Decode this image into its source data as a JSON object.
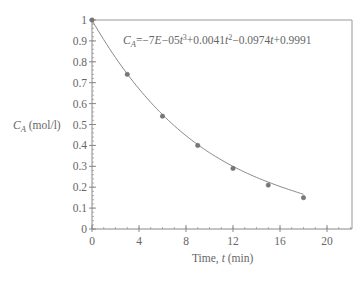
{
  "chart_data": {
    "type": "scatter",
    "title": "",
    "xlabel": "Time, t (min)",
    "xlabel_parts": {
      "prefix": "Time, ",
      "var": "t",
      "suffix": " (min)"
    },
    "ylabel": "C_A (mol/l)",
    "ylabel_parts": {
      "var": "C",
      "sub": "A",
      "suffix": " (mol/l)"
    },
    "xlim": [
      0,
      22
    ],
    "ylim": [
      0,
      1
    ],
    "x_ticks": [
      0,
      4,
      8,
      12,
      16,
      20
    ],
    "x_tick_labels": [
      "0",
      "4",
      "8",
      "12",
      "16",
      "20"
    ],
    "y_ticks": [
      0,
      0.1,
      0.2,
      0.3,
      0.4,
      0.5,
      0.6,
      0.7,
      0.8,
      0.9,
      1
    ],
    "y_tick_labels": [
      "0",
      "0.1",
      "0.2",
      "0.3",
      "0.4",
      "0.5",
      "0.6",
      "0.7",
      "0.8",
      "0.9",
      "1"
    ],
    "grid": false,
    "series": [
      {
        "name": "Measured C_A",
        "x": [
          0,
          3,
          6,
          9,
          12,
          15,
          18
        ],
        "values": [
          1.0,
          0.74,
          0.54,
          0.4,
          0.29,
          0.21,
          0.15
        ],
        "marker": "circle",
        "color": "#777777"
      },
      {
        "name": "Polynomial fit",
        "type": "line",
        "coefficients": {
          "t3": -7e-05,
          "t2": 0.0041,
          "t1": -0.0974,
          "c": 0.9991
        },
        "range": [
          0,
          18
        ],
        "color": "#777777"
      }
    ],
    "annotation": {
      "text": "C_A = -7E-05t^3 + 0.0041t^2 - 0.0974t + 0.9991",
      "lhs_var": "C",
      "lhs_sub": "A",
      "rhs": "=−7E−05t³+0.0041t²−0.0974t+0.9991",
      "parts": [
        "=−7",
        "E",
        "−05",
        "t",
        "3",
        "+0.0041",
        "t",
        "2",
        "−0.0974",
        "t",
        "+0.9991"
      ]
    }
  },
  "colors": {
    "axis": "#888888",
    "line": "#888888",
    "marker": "#777777",
    "text": "#666666"
  }
}
